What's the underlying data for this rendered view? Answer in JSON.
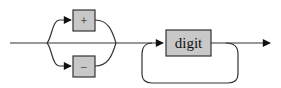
{
  "diagram": {
    "type": "railroad-syntax-diagram",
    "optional_sign_choices": [
      {
        "id": "plus",
        "label": "+"
      },
      {
        "id": "minus",
        "label": "−"
      }
    ],
    "repeated_element": {
      "id": "digit",
      "label": "digit"
    },
    "colors": {
      "box_fill": "#c8c8c8",
      "stroke": "#333333",
      "text": "#111111",
      "background": "#ffffff"
    }
  }
}
